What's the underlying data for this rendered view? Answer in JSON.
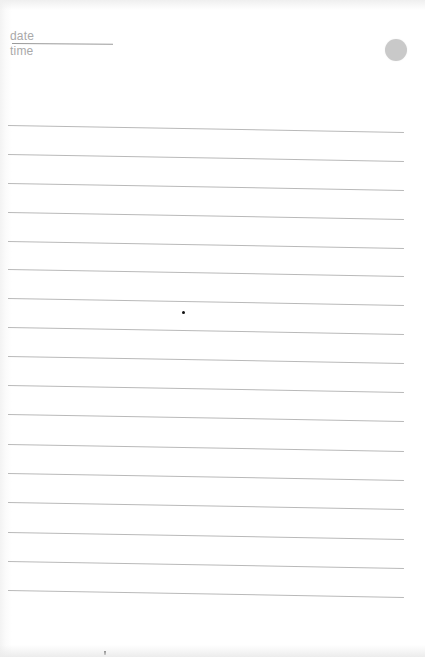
{
  "notepad": {
    "header": {
      "date_label": "date",
      "time_label": "time"
    },
    "circle_mark_color": "#c9c9c9",
    "rule_color": "#b9b9b9",
    "rule_count": 17,
    "rules_left_y": [
      125,
      154,
      183,
      212,
      241,
      269,
      298,
      327,
      356,
      385,
      414,
      444,
      473,
      502,
      532,
      561,
      590
    ]
  }
}
